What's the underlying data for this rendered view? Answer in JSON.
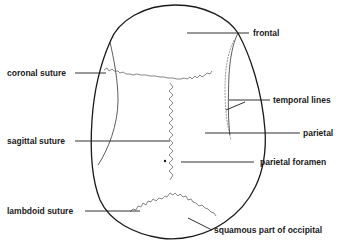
{
  "diagram": {
    "colors": {
      "ink": "#1a1a1a",
      "suture": "#555555",
      "background": "#ffffff"
    },
    "labels": [
      {
        "id": "frontal",
        "text": "frontal",
        "side": "right"
      },
      {
        "id": "coronal-suture",
        "text": "coronal suture",
        "side": "left"
      },
      {
        "id": "temporal-lines",
        "text": "temporal lines",
        "side": "right"
      },
      {
        "id": "parietal",
        "text": "parietal",
        "side": "right"
      },
      {
        "id": "sagittal-suture",
        "text": "sagittal suture",
        "side": "left"
      },
      {
        "id": "parietal-foramen",
        "text": "parietal foramen",
        "side": "right"
      },
      {
        "id": "lambdoid-suture",
        "text": "lambdoid suture",
        "side": "left"
      },
      {
        "id": "squamous-part-of-occipital",
        "text": "squamous part of occipital",
        "side": "right"
      }
    ]
  }
}
